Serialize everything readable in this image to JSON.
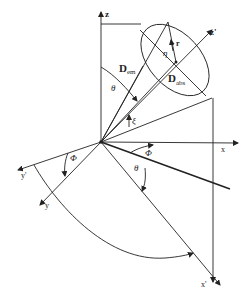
{
  "diagram": {
    "type": "coordinate-geometry",
    "labels": {
      "z": "z",
      "z_prime": "z'",
      "x": "x",
      "x_prime": "x'",
      "y": "y",
      "y_prime": "y'",
      "D": "D",
      "em": "em",
      "abs": "abs",
      "r": "r",
      "eta": "η",
      "theta_top": "θ",
      "theta_bottom": "θ",
      "xi": "ξ",
      "phi_left": "Φ",
      "phi_right": "Φ"
    },
    "colors": {
      "line": "#222222",
      "background": "#ffffff"
    }
  }
}
